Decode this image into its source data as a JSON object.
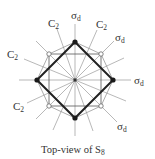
{
  "figure": {
    "caption_text": "Top-view of S",
    "caption_subscript": "8",
    "center": [
      75,
      80
    ],
    "colors": {
      "bold_square": "#222222",
      "thin_lines": "#9a9a9a",
      "labels": "#333333"
    }
  },
  "labels": {
    "sigma_top": {
      "main": "σ",
      "sub": "d"
    },
    "sigma_upper_right": {
      "main": "σ",
      "sub": "d"
    },
    "sigma_right": {
      "main": "σ",
      "sub": "d"
    },
    "sigma_lower_right": {
      "main": "σ",
      "sub": "d"
    },
    "c2_upper_left": {
      "main": "C",
      "sub": "2"
    },
    "c2_upper_right": {
      "main": "C",
      "sub": "2"
    },
    "c2_left": {
      "main": "C",
      "sub": "2"
    },
    "c2_lower_left": {
      "main": "C",
      "sub": "2"
    }
  }
}
